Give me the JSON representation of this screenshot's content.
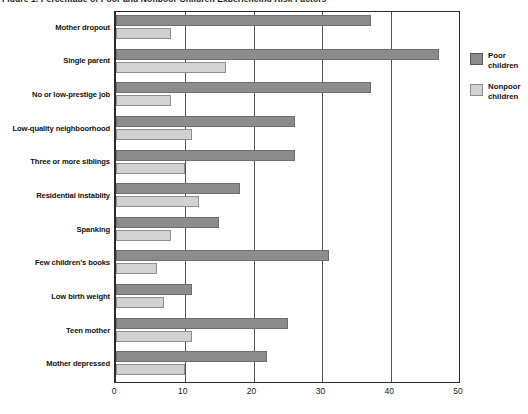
{
  "title": "Figure 1. Percentage of Poor and Nonpoor Children Experiencing Risk Factors",
  "legend": {
    "items": [
      {
        "label": "Poor children",
        "color": "#8c8c8c",
        "key": "poor"
      },
      {
        "label": "Nonpoor children",
        "color": "#d2d2d2",
        "key": "nonpoor"
      }
    ]
  },
  "axis": {
    "x_ticks": [
      "0",
      "10",
      "20",
      "30",
      "40",
      "50"
    ]
  },
  "chart_data": {
    "type": "bar",
    "orientation": "horizontal",
    "title": "Figure 1. Percentage of Poor and Nonpoor Children Experiencing Risk Factors",
    "xlabel": "",
    "ylabel": "",
    "xlim": [
      0,
      50
    ],
    "xticks": [
      0,
      10,
      20,
      30,
      40,
      50
    ],
    "grid": true,
    "legend_position": "right",
    "categories": [
      "Mother dropout",
      "Single parent",
      "No or low-prestige job",
      "Low-quality neighboorhood",
      "Three or more siblings",
      "Residential instablity",
      "Spanking",
      "Few children's books",
      "Low birth weight",
      "Teen mother",
      "Mother depressed"
    ],
    "series": [
      {
        "name": "Poor children",
        "color": "#8c8c8c",
        "values": [
          37,
          47,
          37,
          26,
          26,
          18,
          15,
          31,
          11,
          25,
          22
        ]
      },
      {
        "name": "Nonpoor children",
        "color": "#d2d2d2",
        "values": [
          8,
          16,
          8,
          11,
          10,
          12,
          8,
          6,
          7,
          11,
          10
        ]
      }
    ]
  }
}
